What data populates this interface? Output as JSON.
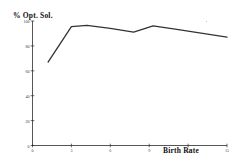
{
  "chart_data": {
    "type": "line",
    "title": "",
    "xlabel": "Birth Rate",
    "ylabel": "% Opt. Sol.",
    "xlim": [
      0,
      15
    ],
    "ylim": [
      0,
      100
    ],
    "grid": false,
    "legend": "none",
    "xticks": [
      0,
      3,
      6,
      9,
      12,
      15
    ],
    "xtick_labels": [
      "0",
      "3",
      "6",
      "9",
      "12",
      "15"
    ],
    "yticks": [
      0,
      20,
      40,
      60,
      80,
      100
    ],
    "ytick_labels": [
      "0",
      "20",
      "40",
      "60",
      "80",
      "100"
    ],
    "series": [
      {
        "name": "% Opt. Sol.",
        "color": "#333333",
        "x": [
          1.2,
          3.0,
          4.2,
          6.0,
          7.8,
          9.3,
          11.0,
          15.0
        ],
        "y": [
          67.0,
          95.5,
          96.5,
          94.0,
          91.0,
          96.0,
          93.5,
          87.0
        ]
      }
    ]
  },
  "axes": {
    "y_title": "% Opt. Sol.",
    "x_title": "Birth Rate"
  }
}
